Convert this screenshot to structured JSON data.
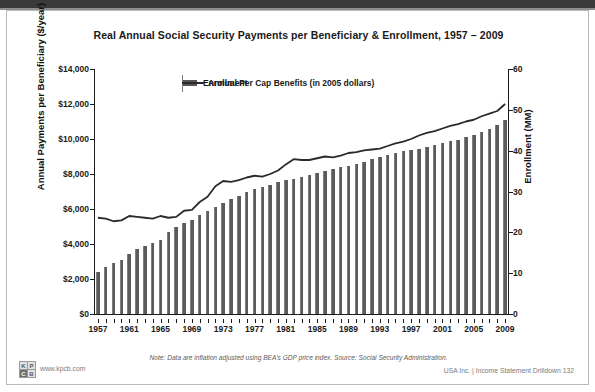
{
  "slide": {
    "title": "Real Annual Social Security Payments per Beneficiary & Enrollment, 1957 – 2009",
    "note": "Note: Data are inflation adjusted using BEA’s GDP price index. Source: Social Security Administration.",
    "footer_right": "USA Inc. | Income Statement Drilldown   132",
    "kpcb_url": "www.kpcb.com",
    "logo_letters": [
      "K",
      "P",
      "C",
      "B"
    ]
  },
  "legend": {
    "items": [
      {
        "label": "Enrollment",
        "type": "bar",
        "color": "#5b5b5b"
      },
      {
        "label": "Annual Per Cap Benefits (in 2005 dollars)",
        "type": "line",
        "color": "#2b2b2b"
      }
    ]
  },
  "chart_data": {
    "type": "bar",
    "title": "Real Annual Social Security Payments per Beneficiary & Enrollment, 1957 – 2009",
    "subtitle": "",
    "xlabel": "",
    "ylabel": "Annual Payments per Beneficiary ($/year)",
    "y2label": "Enrollment (MM)",
    "grid": false,
    "legend_position": "top-center",
    "ylim": [
      0,
      14000
    ],
    "yticks": [
      0,
      2000,
      4000,
      6000,
      8000,
      10000,
      12000,
      14000
    ],
    "ytick_labels": [
      "$0",
      "$2,000",
      "$4,000",
      "$6,000",
      "$8,000",
      "$10,000",
      "$12,000",
      "$14,000"
    ],
    "y2lim": [
      0,
      60
    ],
    "y2ticks": [
      0,
      10,
      20,
      30,
      40,
      50,
      60
    ],
    "y2tick_labels": [
      "0",
      "10",
      "20",
      "30",
      "40",
      "50",
      "60"
    ],
    "x_tick_labels": [
      "1957",
      "1961",
      "1965",
      "1969",
      "1973",
      "1977",
      "1981",
      "1985",
      "1989",
      "1993",
      "1997",
      "2001",
      "2005",
      "2009"
    ],
    "categories": [
      1957,
      1958,
      1959,
      1960,
      1961,
      1962,
      1963,
      1964,
      1965,
      1966,
      1967,
      1968,
      1969,
      1970,
      1971,
      1972,
      1973,
      1974,
      1975,
      1976,
      1977,
      1978,
      1979,
      1980,
      1981,
      1982,
      1983,
      1984,
      1985,
      1986,
      1987,
      1988,
      1989,
      1990,
      1991,
      1992,
      1993,
      1994,
      1995,
      1996,
      1997,
      1998,
      1999,
      2000,
      2001,
      2002,
      2003,
      2004,
      2005,
      2006,
      2007,
      2008,
      2009
    ],
    "series": [
      {
        "name": "Enrollment",
        "axis": "right",
        "units": "MM",
        "type": "bar",
        "color": "#5b5b5b",
        "values": [
          10.3,
          11.6,
          12.6,
          13.3,
          14.6,
          15.8,
          16.6,
          17.4,
          18.1,
          20.2,
          21.4,
          22.4,
          23.1,
          24.3,
          25.2,
          26.1,
          27.2,
          28.1,
          29.0,
          29.8,
          30.5,
          31.1,
          31.7,
          32.3,
          32.8,
          33.1,
          33.6,
          34.0,
          34.5,
          35.1,
          35.5,
          35.9,
          36.3,
          36.7,
          37.2,
          37.9,
          38.5,
          39.0,
          39.5,
          39.8,
          40.2,
          40.5,
          40.9,
          41.3,
          41.8,
          42.3,
          42.7,
          43.3,
          43.9,
          44.6,
          45.4,
          46.3,
          47.5
        ]
      },
      {
        "name": "Annual Per Cap Benefits (in 2005 dollars)",
        "axis": "left",
        "units": "$/year",
        "type": "line",
        "color": "#2b2b2b",
        "values": [
          5500,
          5450,
          5300,
          5350,
          5600,
          5550,
          5500,
          5450,
          5600,
          5500,
          5550,
          5900,
          5950,
          6400,
          6700,
          7300,
          7600,
          7550,
          7650,
          7800,
          7900,
          7850,
          8000,
          8200,
          8550,
          8850,
          8800,
          8800,
          8900,
          9000,
          8950,
          9050,
          9200,
          9250,
          9350,
          9400,
          9450,
          9600,
          9750,
          9850,
          10000,
          10200,
          10350,
          10450,
          10600,
          10750,
          10850,
          11000,
          11100,
          11300,
          11450,
          11600,
          12000
        ]
      }
    ]
  }
}
